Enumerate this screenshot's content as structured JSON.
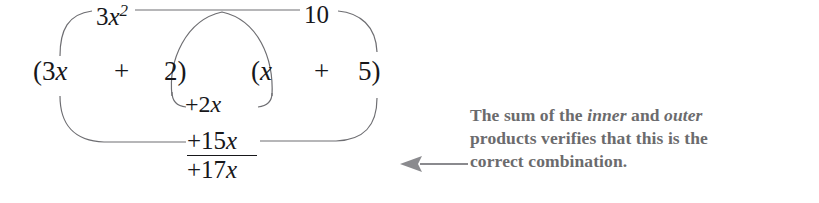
{
  "figure": {
    "name": "foil-multiplication-diagram",
    "background_color": "#ffffff",
    "math_color": "#17171a",
    "caption_color": "#6b6b6d",
    "curve_color": "#6e6e72"
  },
  "expression": {
    "terms": [
      {
        "id": "open-3x",
        "text": "(3x",
        "coefficient": "3",
        "variable": "x"
      },
      {
        "id": "plus-1",
        "text": "+"
      },
      {
        "id": "2-close",
        "text": "2)",
        "constant": "2"
      },
      {
        "id": "open-x",
        "text": "(x",
        "variable": "x"
      },
      {
        "id": "plus-2",
        "text": "+"
      },
      {
        "id": "5-close",
        "text": "5)",
        "constant": "5"
      }
    ],
    "full_text": "(3x + 2)(x + 5)"
  },
  "products": {
    "first": {
      "label_text": "3x",
      "exponent": "2",
      "description": "first-product"
    },
    "outer": {
      "label_text": "10",
      "description": "outer-product"
    },
    "inner": {
      "label_text": "+2x",
      "description": "inner-product"
    },
    "sum_partial": {
      "label_text": "+15x",
      "description": "sum-of-inner-and-outer"
    },
    "total": {
      "label_text": "+17x",
      "description": "middle-term-total"
    }
  },
  "caption": {
    "line_1_pre": "The sum of the ",
    "emphasis_1": "inner",
    "line_1_mid": " and ",
    "emphasis_2": "outer",
    "line_2": "products verifies that this is the",
    "line_3": "correct combination."
  },
  "arrow": {
    "direction": "left",
    "color": "#8a8a8e"
  }
}
